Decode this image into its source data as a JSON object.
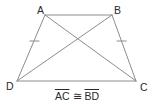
{
  "figure": {
    "type": "isosceles-trapezoid",
    "colors": {
      "stroke": "#8c8c8c",
      "text": "#2a2a2a",
      "background": "#ffffff"
    },
    "vertices": [
      {
        "id": "A",
        "label": "A",
        "x": 45,
        "y": 15
      },
      {
        "id": "B",
        "label": "B",
        "x": 112,
        "y": 15
      },
      {
        "id": "C",
        "label": "C",
        "x": 136,
        "y": 81
      },
      {
        "id": "D",
        "label": "D",
        "x": 17,
        "y": 81
      }
    ],
    "segments": [
      {
        "from": "A",
        "to": "B",
        "role": "side"
      },
      {
        "from": "B",
        "to": "C",
        "role": "side",
        "tick": 1
      },
      {
        "from": "C",
        "to": "D",
        "role": "side"
      },
      {
        "from": "D",
        "to": "A",
        "role": "side",
        "tick": 1
      },
      {
        "from": "A",
        "to": "C",
        "role": "diagonal"
      },
      {
        "from": "B",
        "to": "D",
        "role": "diagonal"
      }
    ]
  },
  "labels": {
    "A": "A",
    "B": "B",
    "C": "C",
    "D": "D"
  },
  "caption": {
    "left": "AC",
    "symbol": "≅",
    "right": "BD"
  }
}
